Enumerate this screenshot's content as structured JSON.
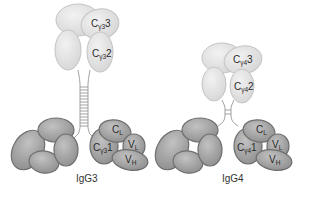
{
  "diagram": {
    "type": "antibody-structure",
    "colors": {
      "fc_fill_light": "#e2e2e2",
      "fc_stroke": "#bdbdbd",
      "fab_fill_dark": "#a6a6a6",
      "fab_stroke": "#6e6e6e",
      "hinge": "#8a8a8a",
      "background": "#ffffff"
    },
    "molecules": [
      {
        "name": "IgG3",
        "caption": "IgG3",
        "domains": {
          "ch3": {
            "main": "C",
            "sub": "γ3",
            "num": "3"
          },
          "ch2": {
            "main": "C",
            "sub": "γ3",
            "num": "2"
          },
          "ch1": {
            "main": "C",
            "sub": "γ3",
            "num": "1"
          },
          "cl": {
            "main": "C",
            "sub": "L"
          },
          "vl": {
            "main": "V",
            "sub": "L"
          },
          "vh": {
            "main": "V",
            "sub": "H"
          }
        },
        "hinge": "long (extended)"
      },
      {
        "name": "IgG4",
        "caption": "IgG4",
        "domains": {
          "ch3": {
            "main": "C",
            "sub": "γ4",
            "num": "3"
          },
          "ch2": {
            "main": "C",
            "sub": "γ4",
            "num": "2"
          },
          "ch1": {
            "main": "C",
            "sub": "γ4",
            "num": "1"
          },
          "cl": {
            "main": "C",
            "sub": "L"
          },
          "vl": {
            "main": "V",
            "sub": "L"
          },
          "vh": {
            "main": "V",
            "sub": "H"
          }
        },
        "hinge": "short"
      }
    ]
  }
}
